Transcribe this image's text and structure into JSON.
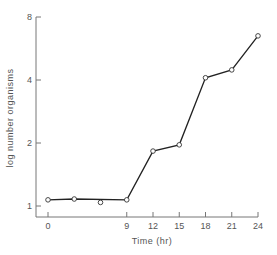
{
  "chart_data": {
    "type": "line",
    "title": "",
    "xlabel": "Time (hr)",
    "ylabel": "log number organisms",
    "x_ticks": [
      0,
      9,
      12,
      15,
      18,
      21,
      24
    ],
    "x_tick_labels": [
      "0",
      "9",
      "12",
      "15",
      "18",
      "21",
      "24"
    ],
    "y_ticks": [
      1,
      2,
      4,
      8
    ],
    "y_tick_labels": [
      "1",
      "2",
      "4",
      "8"
    ],
    "y_scale": "log2",
    "xlim": [
      0,
      24
    ],
    "ylim": [
      1,
      8
    ],
    "grid": false,
    "legend": null,
    "series": [
      {
        "name": "growth",
        "connected": true,
        "points": [
          {
            "x": 0,
            "y": 1.07
          },
          {
            "x": 3,
            "y": 1.08
          },
          {
            "x": 9,
            "y": 1.07
          },
          {
            "x": 12,
            "y": 1.83
          },
          {
            "x": 15,
            "y": 1.96
          },
          {
            "x": 18,
            "y": 4.1
          },
          {
            "x": 21,
            "y": 4.47
          },
          {
            "x": 24,
            "y": 6.5
          }
        ]
      },
      {
        "name": "outlier",
        "connected": false,
        "points": [
          {
            "x": 6,
            "y": 1.04
          }
        ]
      }
    ]
  },
  "colors": {
    "axis": "#777777",
    "line": "#222222",
    "marker_fill": "#ffffff",
    "marker_stroke": "#333333"
  }
}
